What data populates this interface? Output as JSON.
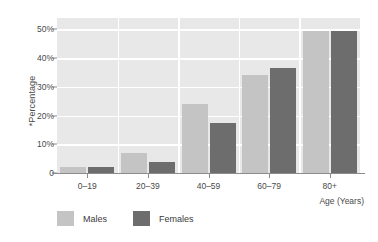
{
  "chart_data": {
    "type": "bar",
    "title": "",
    "subtitle": "",
    "xlabel": "Age (Years)",
    "ylabel": "*Percentage",
    "categories": [
      "0–19",
      "20–39",
      "40–59",
      "60–79",
      "80+"
    ],
    "series": [
      {
        "name": "Males",
        "color": "#c4c4c4",
        "values": [
          2.0,
          6.8,
          24.0,
          34.0,
          49.5
        ]
      },
      {
        "name": "Females",
        "color": "#6d6d6d",
        "values": [
          2.0,
          3.7,
          17.5,
          36.5,
          49.5
        ]
      }
    ],
    "ylim": [
      0,
      54
    ],
    "yticks": [
      0,
      10,
      20,
      30,
      40,
      50
    ],
    "ytick_labels": [
      "0",
      "10%",
      "20%",
      "30%",
      "40%",
      "50%"
    ],
    "grid": true,
    "grid_color": "#ffffff",
    "plot_background": "#e8e8e8",
    "legend_position": "bottom-left",
    "legend_entries": [
      "Males",
      "Females"
    ]
  }
}
